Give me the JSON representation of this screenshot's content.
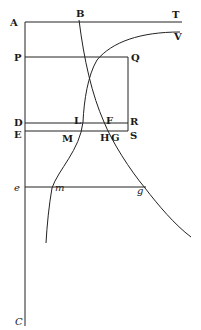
{
  "diagram": {
    "type": "geometric-figure",
    "colors": {
      "ink": "#222222",
      "background": "#ffffff"
    },
    "labels": {
      "A": "A",
      "B": "B",
      "T": "T",
      "V": "V",
      "P": "P",
      "Q": "Q",
      "D": "D",
      "L": "L",
      "F": "F",
      "R": "R",
      "E": "E",
      "M": "M",
      "H": "H",
      "G": "G",
      "S": "S",
      "e": "e",
      "m": "m",
      "g": "g",
      "C": "C"
    },
    "lines": [
      {
        "name": "AT",
        "from": "A",
        "to": "T"
      },
      {
        "name": "AC",
        "from": "A",
        "to": "C"
      },
      {
        "name": "PQ",
        "from": "P",
        "to": "Q"
      },
      {
        "name": "QS",
        "from": "Q",
        "to": "S"
      },
      {
        "name": "DR",
        "from": "D",
        "to": "R"
      },
      {
        "name": "ES",
        "from": "E",
        "to": "S"
      },
      {
        "name": "eg",
        "from": "e",
        "to": "g"
      }
    ],
    "curves": [
      {
        "name": "curve-B",
        "passes_through": [
          "B",
          "F",
          "G",
          "g"
        ]
      },
      {
        "name": "curve-V",
        "passes_through": [
          "V",
          "L",
          "M",
          "m"
        ]
      }
    ]
  }
}
